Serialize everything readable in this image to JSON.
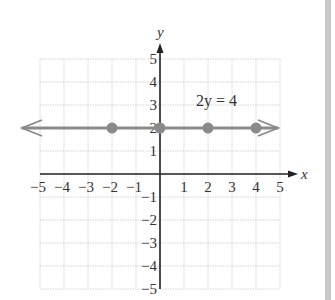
{
  "chart_data": {
    "type": "line",
    "title": "",
    "xlabel": "x",
    "ylabel": "y",
    "xlim": [
      -5,
      5
    ],
    "ylim": [
      -5,
      5
    ],
    "grid": true,
    "x_ticks": [
      -5,
      -4,
      -3,
      -2,
      -1,
      1,
      2,
      3,
      4,
      5
    ],
    "y_ticks": [
      -5,
      -4,
      -3,
      -2,
      -1,
      1,
      2,
      3,
      4,
      5
    ],
    "x_tick_labels": [
      "−5",
      "−4",
      "−3",
      "−2",
      "−1",
      "1",
      "2",
      "3",
      "4",
      "5"
    ],
    "y_tick_labels": [
      "−5",
      "−4",
      "−3",
      "−2",
      "−1",
      "1",
      "2",
      "3",
      "4",
      "5"
    ],
    "series": [
      {
        "name": "2y = 4",
        "equation": "2y = 4",
        "line": "horizontal, y = 2, arrows both ends",
        "points": [
          {
            "x": -2,
            "y": 2
          },
          {
            "x": 0,
            "y": 2
          },
          {
            "x": 2,
            "y": 2
          },
          {
            "x": 4,
            "y": 2
          }
        ]
      }
    ],
    "annotations": [
      {
        "text": "2y = 4",
        "x": 2.5,
        "y": 3
      }
    ]
  },
  "labels": {
    "equation": "2y = 4",
    "x_axis": "x",
    "y_axis": "y"
  },
  "colors": {
    "line": "#8a8a8a",
    "points": "#8a8a8a",
    "axes": "#222222",
    "grid": "#d4d4d4",
    "side_bar": "#c8c8c8"
  }
}
